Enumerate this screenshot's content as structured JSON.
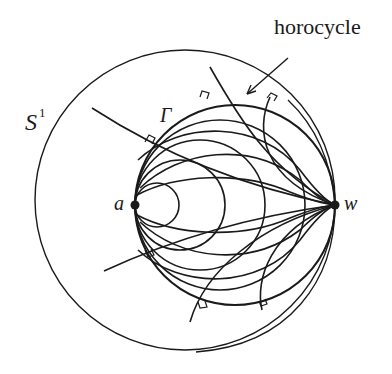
{
  "diagram": {
    "labels": {
      "horocycle": "horocycle",
      "outer_circle": "S",
      "outer_circle_sup": "1",
      "inner_circle": "Γ",
      "point_a": "a",
      "point_w": "w"
    },
    "colors": {
      "stroke": "#1a1a1a",
      "background": "#ffffff"
    },
    "geometry": {
      "outer_circle": {
        "cx": 185,
        "cy": 200,
        "r": 150
      },
      "gamma_circle": {
        "cx": 235,
        "cy": 205,
        "r": 100
      },
      "point_a": {
        "x": 135,
        "y": 205
      },
      "point_w": {
        "x": 335,
        "y": 205
      },
      "horocycles_at_a_radii": [
        22,
        45,
        65,
        85
      ]
    }
  }
}
